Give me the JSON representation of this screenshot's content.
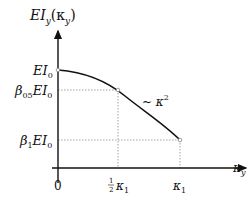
{
  "diagram": {
    "type": "function-plot",
    "y_axis_label": {
      "main": "EI",
      "sub": "y",
      "paren": "(κ",
      "paren_sub": "y",
      "close": ")"
    },
    "x_axis_label": {
      "main": "κ",
      "sub": "y"
    },
    "y_ticks": [
      {
        "id": "ei0",
        "main": "EI",
        "sub": "0",
        "prefix": "",
        "prefix_sub": ""
      },
      {
        "id": "beta05",
        "main": "EI",
        "sub": "0",
        "prefix": "β",
        "prefix_sub": "05"
      },
      {
        "id": "beta1",
        "main": "EI",
        "sub": "0",
        "prefix": "β",
        "prefix_sub": "1"
      }
    ],
    "x_ticks": [
      {
        "id": "origin",
        "label": "0"
      },
      {
        "id": "half",
        "frac_num": "1",
        "frac_den": "2",
        "main": "κ",
        "sub": "1"
      },
      {
        "id": "k1",
        "main": "κ",
        "sub": "1"
      }
    ],
    "curve_annotation": {
      "prefix": "~ κ",
      "sup": "2"
    },
    "colors": {
      "axis": "#111111",
      "curve": "#111111",
      "guide": "#999999"
    }
  }
}
